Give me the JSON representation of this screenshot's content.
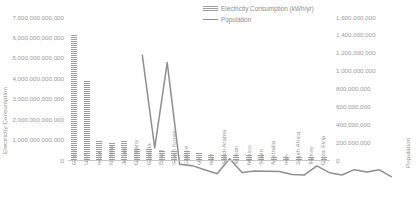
{
  "chart_data": {
    "type": "bar",
    "title": "",
    "xlabel": "",
    "ylabel": "Electricity Consumption",
    "y2label": "Population",
    "grid": false,
    "legend_position": "top-center",
    "categories": [
      "China",
      "USA",
      "India",
      "Russia",
      "Japan",
      "Germany",
      "Canada",
      "Brazil",
      "South Korea",
      "France",
      "UK",
      "Italy",
      "Saudi Arabia",
      "Taiwan",
      "Mexico",
      "Spain",
      "Australia",
      "Iran",
      "South Africa",
      "Turkey",
      "Gaza Strip"
    ],
    "ylim": [
      0,
      7000000000000
    ],
    "ytick_labels": [
      "7,000,000,000,000",
      "6,000,000,000,000",
      "5,000,000,000,000",
      "4,000,000,000,000",
      "3,000,000,000,000",
      "2,000,000,000,000",
      "1,000,000,000,000",
      "0"
    ],
    "ytick_values": [
      7000000000000,
      6000000000000,
      5000000000000,
      4000000000000,
      3000000000000,
      2000000000000,
      1000000000000,
      0
    ],
    "y2lim": [
      0,
      1600000000
    ],
    "y2tick_labels": [
      "1,600,000,000",
      "1,400,000,000",
      "1,200,000,000",
      "1,000,000,000",
      "800,000,000",
      "600,000,000",
      "400,000,000",
      "200,000,000",
      "0"
    ],
    "y2tick_values": [
      1600000000,
      1400000000,
      1200000000,
      1000000000,
      800000000,
      600000000,
      400000000,
      200000000,
      0
    ],
    "series": [
      {
        "name": "Electricity Consumption (kWh/yr)",
        "chart_type": "bar",
        "axis": "left",
        "values": [
          6100000000000,
          3900000000000,
          1000000000000,
          900000000000,
          950000000000,
          540000000000,
          530000000000,
          500000000000,
          480000000000,
          430000000000,
          320000000000,
          300000000000,
          260000000000,
          240000000000,
          230000000000,
          240000000000,
          220000000000,
          200000000000,
          210000000000,
          200000000000,
          190000000000
        ]
      },
      {
        "name": "Population",
        "chart_type": "line",
        "axis": "right",
        "values": [
          1370000000,
          325000000,
          1280000000,
          142000000,
          127000000,
          81000000,
          36000000,
          205000000,
          51000000,
          67000000,
          65000000,
          62000000,
          28000000,
          23000000,
          124000000,
          48000000,
          23000000,
          82000000,
          55000000,
          80000000,
          1800000
        ]
      }
    ]
  },
  "legend": {
    "entries": [
      {
        "label": "Electricity Consumption (kWh/yr)",
        "marker": "bar-swatch-icon"
      },
      {
        "label": "Population",
        "marker": "line-swatch-icon"
      }
    ]
  }
}
